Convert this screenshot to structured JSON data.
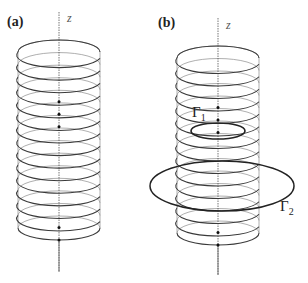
{
  "panels": [
    {
      "label": "(a)",
      "axis_label": "z",
      "description": "Solenoid (helical coil) around z-axis",
      "coils": 15
    },
    {
      "label": "(b)",
      "axis_label": "z",
      "description": "Solenoid with Amperian loops",
      "coils": 15,
      "loops": [
        {
          "symbol": "Γ",
          "subscript": "1",
          "position": "inside solenoid"
        },
        {
          "symbol": "Γ",
          "subscript": "2",
          "position": "encircling solenoid"
        }
      ]
    }
  ],
  "colors": {
    "front_coil": "#3a3a3a",
    "back_coil": "#9a9a9a",
    "axis": "#666666",
    "loop": "#222222"
  }
}
